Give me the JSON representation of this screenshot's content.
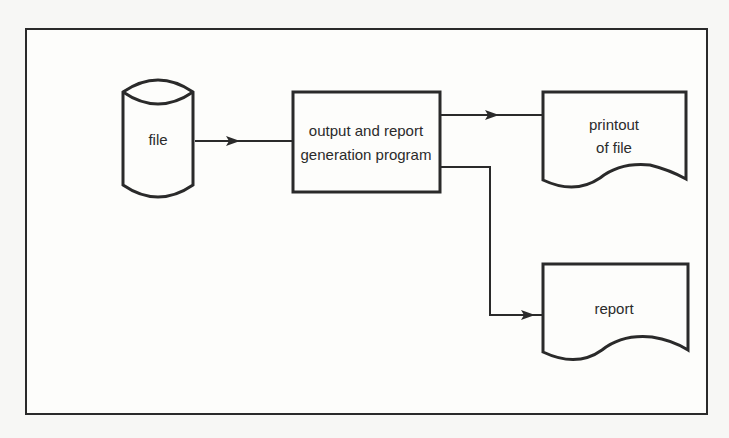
{
  "diagram": {
    "type": "flowchart",
    "nodes": {
      "file": {
        "shape": "cylinder",
        "label": "file"
      },
      "program": {
        "shape": "process",
        "line1": "output and report",
        "line2": "generation program"
      },
      "printout": {
        "shape": "document",
        "line1": "printout",
        "line2": "of file"
      },
      "report": {
        "shape": "document",
        "label": "report"
      }
    },
    "edges": [
      {
        "from": "file",
        "to": "program"
      },
      {
        "from": "program",
        "to": "printout"
      },
      {
        "from": "program",
        "to": "report"
      }
    ],
    "colors": {
      "stroke": "#2a2a2a",
      "background": "#fdfdfb"
    }
  }
}
